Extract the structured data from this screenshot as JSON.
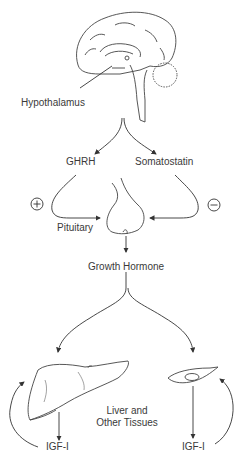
{
  "diagram": {
    "nodes": {
      "hypothalamus": "Hypothalamus",
      "ghrh": "GHRH",
      "somatostatin": "Somatostatin",
      "pituitary": "Pituitary",
      "growth_hormone": "Growth Hormone",
      "tissues_line1": "Liver and",
      "tissues_line2": "Other Tissues",
      "igf_liver": "IGF-I",
      "igf_cell": "IGF-I"
    },
    "signs": {
      "stimulatory": "+",
      "inhibitory": "−"
    },
    "edges": [
      {
        "from": "Hypothalamus",
        "to": "GHRH"
      },
      {
        "from": "Hypothalamus",
        "to": "Somatostatin"
      },
      {
        "from": "GHRH",
        "to": "Pituitary",
        "effect": "+"
      },
      {
        "from": "Somatostatin",
        "to": "Pituitary",
        "effect": "−"
      },
      {
        "from": "Pituitary",
        "to": "Growth Hormone"
      },
      {
        "from": "Growth Hormone",
        "to": "Liver"
      },
      {
        "from": "Growth Hormone",
        "to": "Other Tissues (cell)"
      },
      {
        "from": "Liver",
        "to": "IGF-I"
      },
      {
        "from": "Cell",
        "to": "IGF-I"
      },
      {
        "from": "IGF-I",
        "to": "Liver",
        "type": "autocrine feedback"
      },
      {
        "from": "IGF-I",
        "to": "Cell",
        "type": "autocrine feedback"
      }
    ],
    "line_color": "#333333"
  }
}
